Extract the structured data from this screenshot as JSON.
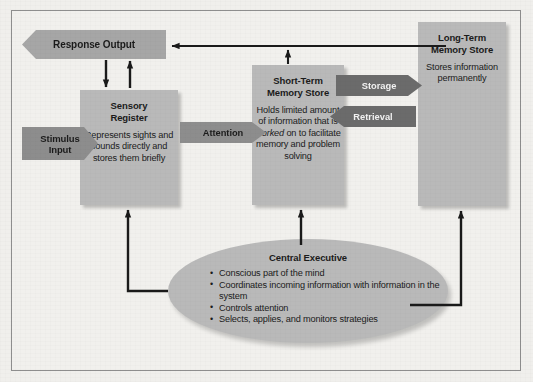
{
  "diagram": {
    "colors": {
      "page_background": "#f0efec",
      "frame_border": "#8e8e8e",
      "box_fill": "#b9b9b9",
      "banner_light": "#a6a6a6",
      "banner_mid": "#8d8d8d",
      "banner_dark": "#6b6b6b",
      "arrow": "#1a1a1a",
      "text": "#1b1b1b"
    },
    "banners": [
      {
        "id": "response-output",
        "label": "Response Output",
        "direction": "left",
        "shade": "light"
      },
      {
        "id": "stimulus-input",
        "label": "Stimulus Input",
        "label_line1": "Stimulus",
        "label_line2": "Input",
        "direction": "right",
        "shade": "mid"
      },
      {
        "id": "attention",
        "label": "Attention",
        "direction": "right",
        "shade": "mid"
      },
      {
        "id": "storage",
        "label": "Storage",
        "direction": "right",
        "shade": "dark"
      },
      {
        "id": "retrieval",
        "label": "Retrieval",
        "direction": "left",
        "shade": "dark"
      }
    ],
    "boxes": [
      {
        "id": "sensory-register",
        "title_line1": "Sensory",
        "title_line2": "Register",
        "body": "Represents sights and sounds directly and stores them briefly"
      },
      {
        "id": "short-term-memory-store",
        "title_line1": "Short-Term",
        "title_line2": "Memory Store",
        "body_pre": "Holds limited amount of information that is ",
        "body_em": "worked",
        "body_post": " on to facilitate memory and problem solving"
      },
      {
        "id": "long-term-memory-store",
        "title_line1": "Long-Term",
        "title_line2": "Memory Store",
        "body": "Stores information permanently"
      }
    ],
    "central_executive": {
      "title": "Central Executive",
      "bullets": [
        "Conscious part of the mind",
        "Coordinates incoming information with information in the system",
        "Controls attention",
        "Selects, applies, and monitors strategies"
      ]
    }
  }
}
